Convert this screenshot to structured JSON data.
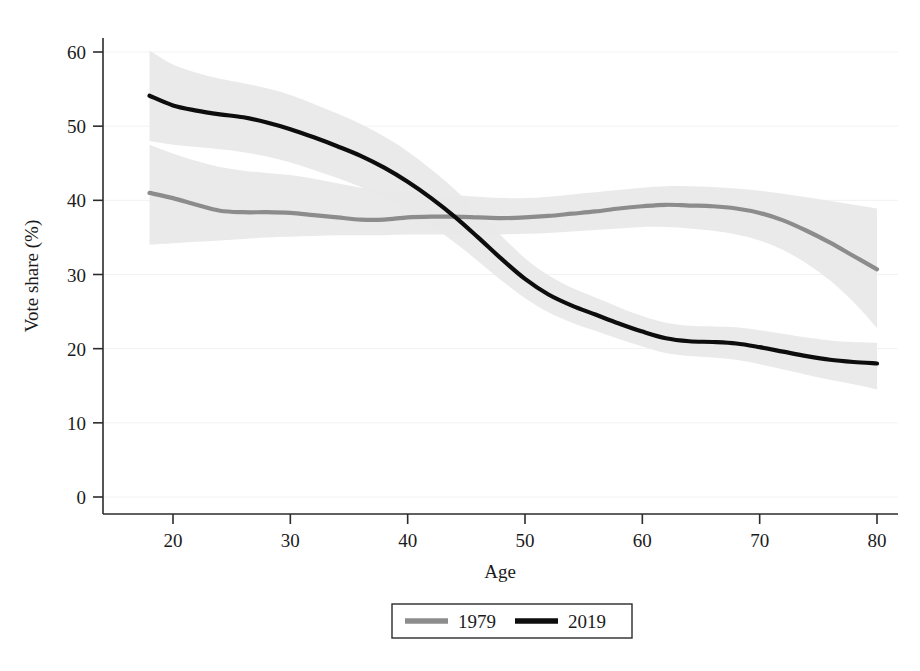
{
  "chart_data": {
    "type": "line",
    "title": "",
    "xlabel": "Age",
    "ylabel": "Vote share (%)",
    "xlim": [
      18,
      80
    ],
    "ylim": [
      0,
      60
    ],
    "xticks": [
      20,
      30,
      40,
      50,
      60,
      70,
      80
    ],
    "yticks": [
      0,
      10,
      20,
      30,
      40,
      50,
      60
    ],
    "grid": true,
    "legend_position": "bottom-center",
    "band_color": "#e9e9e9",
    "series": [
      {
        "name": "1979",
        "color": "#8c8c8c",
        "x": [
          18,
          20,
          22,
          24,
          26,
          28,
          30,
          32,
          34,
          36,
          38,
          40,
          42,
          44,
          46,
          48,
          50,
          52,
          54,
          56,
          58,
          60,
          62,
          64,
          66,
          68,
          70,
          72,
          74,
          76,
          78,
          80
        ],
        "values": [
          41.0,
          40.3,
          39.4,
          38.6,
          38.4,
          38.4,
          38.3,
          38.0,
          37.7,
          37.4,
          37.4,
          37.7,
          37.8,
          37.8,
          37.7,
          37.6,
          37.7,
          37.9,
          38.2,
          38.5,
          38.9,
          39.2,
          39.4,
          39.3,
          39.2,
          38.9,
          38.3,
          37.3,
          35.9,
          34.3,
          32.5,
          30.7
        ],
        "band_lower": [
          34.0,
          34.2,
          34.4,
          34.6,
          34.8,
          35.0,
          35.1,
          35.2,
          35.3,
          35.3,
          35.3,
          35.4,
          35.4,
          35.4,
          35.4,
          35.4,
          35.5,
          35.6,
          35.8,
          36.0,
          36.2,
          36.4,
          36.4,
          36.2,
          35.9,
          35.4,
          34.6,
          33.3,
          31.5,
          29.2,
          26.3,
          22.8
        ],
        "band_upper": [
          47.5,
          46.3,
          45.3,
          44.5,
          44.0,
          43.7,
          43.4,
          42.9,
          42.3,
          41.7,
          41.3,
          41.1,
          40.9,
          40.7,
          40.5,
          40.3,
          40.3,
          40.5,
          40.8,
          41.1,
          41.4,
          41.7,
          41.9,
          41.9,
          41.8,
          41.6,
          41.3,
          40.9,
          40.4,
          39.9,
          39.4,
          38.9
        ]
      },
      {
        "name": "2019",
        "color": "#0d0d0d",
        "x": [
          18,
          20,
          22,
          24,
          26,
          28,
          30,
          32,
          34,
          36,
          38,
          40,
          42,
          44,
          46,
          48,
          50,
          52,
          54,
          56,
          58,
          60,
          62,
          64,
          66,
          68,
          70,
          72,
          74,
          76,
          78,
          80
        ],
        "values": [
          54.1,
          52.8,
          52.1,
          51.6,
          51.2,
          50.5,
          49.6,
          48.5,
          47.3,
          46.0,
          44.4,
          42.5,
          40.3,
          37.8,
          35.0,
          32.1,
          29.4,
          27.3,
          25.8,
          24.6,
          23.4,
          22.3,
          21.4,
          21.0,
          20.9,
          20.7,
          20.2,
          19.6,
          19.0,
          18.5,
          18.2,
          18.0
        ],
        "band_lower": [
          48.0,
          47.5,
          47.2,
          46.9,
          46.5,
          45.9,
          45.1,
          44.1,
          43.0,
          41.8,
          40.3,
          38.6,
          36.6,
          34.3,
          31.8,
          29.2,
          26.8,
          24.9,
          23.5,
          22.4,
          21.3,
          20.3,
          19.4,
          19.0,
          18.8,
          18.5,
          17.9,
          17.2,
          16.5,
          15.8,
          15.2,
          14.5
        ],
        "band_upper": [
          60.2,
          58.3,
          57.2,
          56.4,
          55.8,
          55.1,
          54.2,
          53.0,
          51.7,
          50.3,
          48.6,
          46.6,
          44.2,
          41.5,
          38.4,
          35.2,
          32.2,
          29.9,
          28.2,
          26.9,
          25.6,
          24.4,
          23.5,
          23.1,
          23.0,
          22.9,
          22.5,
          22.0,
          21.5,
          21.1,
          20.9,
          20.8
        ]
      }
    ]
  },
  "legend": {
    "entries": [
      {
        "label": "1979",
        "color": "#8c8c8c"
      },
      {
        "label": "2019",
        "color": "#0d0d0d"
      }
    ]
  },
  "axes": {
    "x_title": "Age",
    "y_title": "Vote share (%)",
    "x_tick_labels": [
      "20",
      "30",
      "40",
      "50",
      "60",
      "70",
      "80"
    ],
    "y_tick_labels": [
      "0",
      "10",
      "20",
      "30",
      "40",
      "50",
      "60"
    ]
  }
}
